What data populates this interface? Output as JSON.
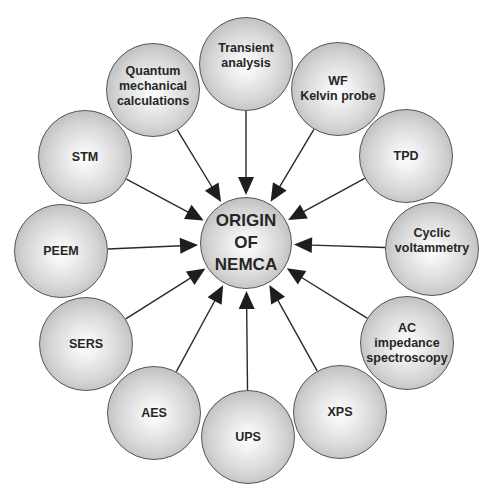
{
  "diagram": {
    "center": {
      "label": "ORIGIN\nOF\nNEMCA",
      "x": 246,
      "y": 243,
      "r": 46
    },
    "nodes": [
      {
        "id": "transient",
        "label": "Transient\nanalysis",
        "x": 246,
        "y": 64,
        "r": 47,
        "ty": -8
      },
      {
        "id": "wf",
        "label": "WF\nKelvin probe",
        "x": 338,
        "y": 89,
        "r": 47,
        "ty": 0
      },
      {
        "id": "tpd",
        "label": "TPD",
        "x": 406,
        "y": 156,
        "r": 47,
        "ty": 0
      },
      {
        "id": "cyclic",
        "label": "Cyclic\nvoltammetry",
        "x": 432,
        "y": 249,
        "r": 47,
        "ty": -8
      },
      {
        "id": "ac",
        "label": "AC\nimpedance\nspectroscopy",
        "x": 407,
        "y": 343,
        "r": 47,
        "ty": 0
      },
      {
        "id": "xps",
        "label": "XPS",
        "x": 340,
        "y": 412,
        "r": 47,
        "ty": 0
      },
      {
        "id": "ups",
        "label": "UPS",
        "x": 248,
        "y": 437,
        "r": 47,
        "ty": 0
      },
      {
        "id": "aes",
        "label": "AES",
        "x": 154,
        "y": 413,
        "r": 47,
        "ty": 0
      },
      {
        "id": "sers",
        "label": "SERS",
        "x": 86,
        "y": 344,
        "r": 47,
        "ty": 0
      },
      {
        "id": "peem",
        "label": "PEEM",
        "x": 61,
        "y": 251,
        "r": 47,
        "ty": 0
      },
      {
        "id": "stm",
        "label": "STM",
        "x": 85,
        "y": 157,
        "r": 47,
        "ty": 0
      },
      {
        "id": "quantum",
        "label": "Quantum\nmechanical\ncalculations",
        "x": 153,
        "y": 90,
        "r": 47,
        "ty": -4
      }
    ],
    "colors": {
      "line": "#2a2a2a",
      "text": "#262626",
      "border": "#555555"
    }
  }
}
